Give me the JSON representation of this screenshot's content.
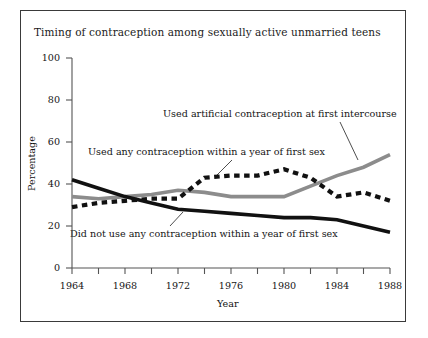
{
  "figure": {
    "title": "Timing of contraception among sexually active unmarried teens",
    "background_color": "#ffffff",
    "frame_color": "#3a3a3a"
  },
  "axes": {
    "ylabel": "Percentage",
    "xlabel": "Year",
    "y_ticks": [
      "100",
      "80",
      "60",
      "40",
      "20",
      "0"
    ],
    "x_ticks": [
      "1964",
      "1968",
      "1972",
      "1976",
      "1980",
      "1984",
      "1988"
    ]
  },
  "annotations": [
    {
      "name": "artificial",
      "text": "Used artificial contraception at first intercourse"
    },
    {
      "name": "any",
      "text": "Used any contraception within a year of first sex"
    },
    {
      "name": "didnot",
      "text": "Did not use any contraception within a year of first sex"
    }
  ],
  "chart_data": {
    "type": "line",
    "title": "Timing of contraception among sexually active unmarried teens",
    "xlabel": "Year",
    "ylabel": "Percentage",
    "xlim": [
      1964,
      1988
    ],
    "ylim": [
      0,
      100
    ],
    "grid": false,
    "legend_position": "inline-annotations",
    "x": [
      1964,
      1966,
      1968,
      1970,
      1972,
      1974,
      1976,
      1978,
      1980,
      1982,
      1984,
      1986,
      1988
    ],
    "series": [
      {
        "name": "Used artificial contraception at first intercourse",
        "style": "solid-gray",
        "color": "#8c8c8c",
        "values": [
          34,
          33,
          34,
          35,
          37,
          36,
          34,
          34,
          34,
          39,
          44,
          48,
          54
        ]
      },
      {
        "name": "Used any contraception within a year of first sex",
        "style": "dashed-black",
        "color": "#111111",
        "values": [
          29,
          31,
          32,
          33,
          33,
          43,
          44,
          44,
          47,
          43,
          34,
          36,
          32
        ]
      },
      {
        "name": "Did not use any contraception within a year of first sex",
        "style": "solid-black",
        "color": "#111111",
        "values": [
          42,
          38,
          34,
          31,
          28,
          27,
          26,
          25,
          24,
          24,
          23,
          20,
          17
        ]
      }
    ]
  }
}
